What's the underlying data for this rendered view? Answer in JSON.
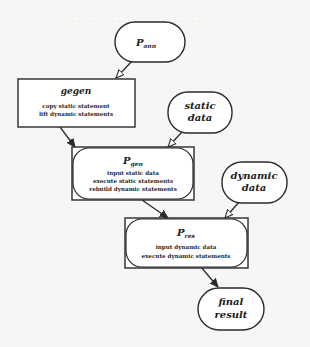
{
  "diagram": {
    "nodes": {
      "p_ann": {
        "label": "P",
        "subscript": "ann",
        "shape": "rounded-pill"
      },
      "gegen": {
        "label": "gegen",
        "shape": "rectangle",
        "lines": [
          "copy static statement",
          "lift dynamic statements"
        ]
      },
      "static_data": {
        "label_line1": "static",
        "label_line2": "data",
        "shape": "rounded-pill"
      },
      "p_gen": {
        "label": "P",
        "subscript": "gen",
        "shape": "rounded-in-rectangle",
        "lines": [
          "input static data",
          "execute static statements",
          "rebuild dynamic statements"
        ]
      },
      "dynamic_data": {
        "label_line1": "dynamic",
        "label_line2": "data",
        "shape": "rounded-pill"
      },
      "p_res": {
        "label": "P",
        "subscript": "res",
        "shape": "rounded-in-rectangle",
        "lines": [
          "input dynamic data",
          "execute dynamic statements"
        ]
      },
      "final_result": {
        "label_line1": "final",
        "label_line2": "result",
        "shape": "rounded-pill"
      }
    },
    "edges": [
      {
        "from": "p_ann",
        "to": "gegen",
        "arrowhead": "open"
      },
      {
        "from": "gegen",
        "to": "p_gen",
        "arrowhead": "filled"
      },
      {
        "from": "static_data",
        "to": "p_gen",
        "arrowhead": "open"
      },
      {
        "from": "p_gen",
        "to": "p_res",
        "arrowhead": "filled"
      },
      {
        "from": "dynamic_data",
        "to": "p_res",
        "arrowhead": "open"
      },
      {
        "from": "p_res",
        "to": "final_result",
        "arrowhead": "filled"
      }
    ],
    "colors": {
      "stroke": "#2a2a2a",
      "background": "#f6f6f4",
      "fill": "#ffffff"
    }
  }
}
